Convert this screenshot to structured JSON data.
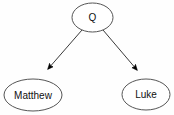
{
  "diagram": {
    "title": "",
    "background_color": "#fefefe",
    "node_fill": "#ffffff",
    "node_stroke": "#555555",
    "edge_color": "#3a3a3a",
    "arrow_color": "#000000",
    "text_color": "#101010",
    "nodes": [
      {
        "id": "q",
        "label": "Q",
        "cx": 92.5,
        "cy": 17.5,
        "rx": 20.5,
        "ry": 14.5,
        "font_size": 10
      },
      {
        "id": "matthew",
        "label": "Matthew",
        "cx": 33,
        "cy": 95,
        "rx": 29,
        "ry": 16,
        "font_size": 10
      },
      {
        "id": "luke",
        "label": "Luke",
        "cx": 146,
        "cy": 94.5,
        "rx": 24,
        "ry": 15.5,
        "font_size": 10
      }
    ],
    "edges": [
      {
        "id": "q-to-matthew",
        "from": "q",
        "to": "matthew",
        "x1": 82,
        "y1": 30,
        "x2": 48,
        "y2": 69,
        "directed": true,
        "label": ""
      },
      {
        "id": "q-to-luke",
        "from": "q",
        "to": "luke",
        "x1": 103,
        "y1": 30,
        "x2": 137,
        "y2": 70,
        "directed": true,
        "label": ""
      }
    ]
  }
}
